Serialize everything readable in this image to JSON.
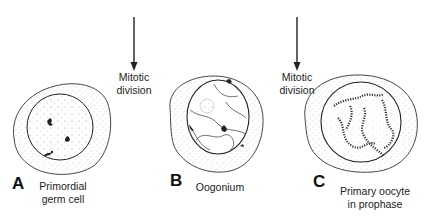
{
  "figure": {
    "arrows": [
      {
        "label_line1": "Mitotic",
        "label_line2": "division"
      },
      {
        "label_line1": "Mitotic",
        "label_line2": "division"
      }
    ],
    "panels": [
      {
        "letter": "A",
        "caption_line1": "Primordial",
        "caption_line2": "germ cell"
      },
      {
        "letter": "B",
        "caption_line1": "Oogonium",
        "caption_line2": ""
      },
      {
        "letter": "C",
        "caption_line1": "Primary oocyte",
        "caption_line2": "in prophase"
      }
    ]
  },
  "colors": {
    "ink": "#1a1a1a",
    "stipple": "#9a9a9a",
    "background": "#ffffff"
  }
}
